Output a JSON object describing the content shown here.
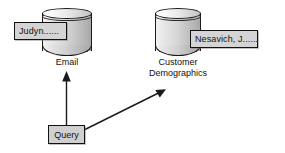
{
  "diagram": {
    "colors": {
      "cylinder_light": "#f2f2f2",
      "cylinder_dark": "#a8a8a8",
      "box_fill": "#d4d4d4",
      "outline": "#111111",
      "arrow": "#1a1a1a",
      "background": "#ffffff"
    },
    "databases": [
      {
        "id": "email",
        "caption": "Email",
        "record_label": "Judyn......"
      },
      {
        "id": "customer-demographics",
        "caption": "Customer\nDemographics",
        "record_label": "Nesavich, J......"
      }
    ],
    "query": {
      "label": "Query"
    },
    "arrows": [
      {
        "id": "query-to-email",
        "from": "Query",
        "to": "Email",
        "direction": "up"
      },
      {
        "id": "query-to-customer-demographics",
        "from": "Query",
        "to": "Customer Demographics",
        "direction": "up-right"
      }
    ]
  }
}
